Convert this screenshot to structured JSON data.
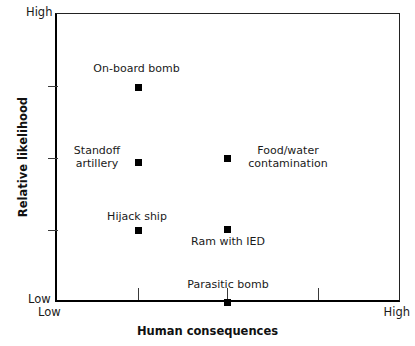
{
  "chart_data": {
    "type": "scatter",
    "title": "",
    "xlabel": "Human consequences",
    "ylabel": "Relative likelihood",
    "x_axis": {
      "min_label": "Low",
      "max_label": "High",
      "ticks": [
        0.24,
        0.5,
        0.76
      ],
      "grid": false
    },
    "y_axis": {
      "min_label": "Low",
      "max_label": "High",
      "ticks": [
        0.25,
        0.5,
        0.75
      ],
      "grid": false
    },
    "xlim": [
      0,
      1
    ],
    "ylim": [
      0,
      1
    ],
    "legend": "none",
    "marker_color": "#000000",
    "points": [
      {
        "label": "On-board bomb",
        "x": 0.24,
        "y": 0.745,
        "label_pos": "above"
      },
      {
        "label": "Standoff\nartillery",
        "x": 0.24,
        "y": 0.485,
        "label_pos": "left"
      },
      {
        "label": "Food/water\ncontamination",
        "x": 0.5,
        "y": 0.5,
        "label_pos": "right"
      },
      {
        "label": "Hijack ship",
        "x": 0.24,
        "y": 0.25,
        "label_pos": "above"
      },
      {
        "label": "Ram with IED",
        "x": 0.5,
        "y": 0.253,
        "label_pos": "below"
      },
      {
        "label": "Parasitic bomb",
        "x": 0.5,
        "y": 0.0,
        "label_pos": "above"
      }
    ]
  },
  "geometry": {
    "markers": [
      {
        "name": "on-board-bomb",
        "left": 138,
        "top": 87
      },
      {
        "name": "standoff-artillery",
        "left": 138,
        "top": 162
      },
      {
        "name": "food-water-contamination",
        "left": 227,
        "top": 158
      },
      {
        "name": "hijack-ship",
        "left": 138,
        "top": 230
      },
      {
        "name": "ram-with-ied",
        "left": 227,
        "top": 229
      },
      {
        "name": "parasitic-bomb",
        "left": 227,
        "top": 302
      }
    ],
    "labels": [
      {
        "name": "on-board-bomb",
        "left": 84,
        "top": 63,
        "width": 105
      },
      {
        "name": "standoff-artillery",
        "left": 66,
        "top": 145,
        "width": 62
      },
      {
        "name": "food-water-contamination",
        "left": 238,
        "top": 145,
        "width": 100
      },
      {
        "name": "hijack-ship",
        "left": 92,
        "top": 211,
        "width": 90
      },
      {
        "name": "ram-with-ied",
        "left": 183,
        "top": 236,
        "width": 90
      },
      {
        "name": "parasitic-bomb",
        "left": 178,
        "top": 279,
        "width": 100
      }
    ],
    "y_ticks_px": [
      86,
      158,
      230
    ],
    "x_ticks_px": [
      138,
      227,
      318
    ]
  },
  "axis_labels": {
    "y_high": "High",
    "y_low": "Low",
    "x_low": "Low",
    "x_high": "High",
    "y_title": "Relative likelihood",
    "x_title": "Human consequences"
  }
}
